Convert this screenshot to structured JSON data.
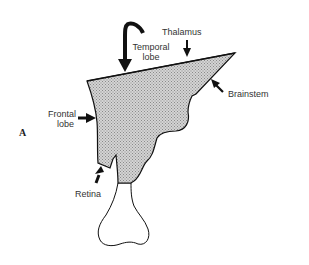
{
  "figure": {
    "panel_label": "A",
    "labels": {
      "temporal_lobe_line1": "Temporal",
      "temporal_lobe_line2": "lobe",
      "thalamus": "Thalamus",
      "brainstem": "Brainstem",
      "frontal_lobe_line1": "Frontal",
      "frontal_lobe_line2": "lobe",
      "retina": "Retina"
    },
    "colors": {
      "outline": "#111111",
      "shade": "#b8b8b8",
      "text": "#333333",
      "background": "#ffffff"
    }
  }
}
